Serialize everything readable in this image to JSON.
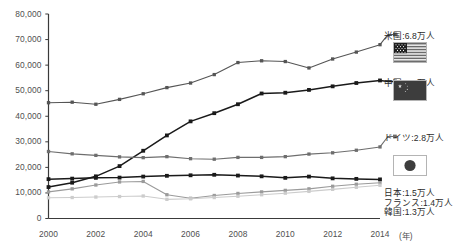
{
  "chart_data": {
    "type": "line",
    "title": "",
    "subtitle": "",
    "xlabel": "年",
    "ylabel": "",
    "x": [
      2000,
      2001,
      2002,
      2003,
      2004,
      2005,
      2006,
      2007,
      2008,
      2009,
      2010,
      2011,
      2012,
      2013,
      2014
    ],
    "xlim": [
      2000,
      2014
    ],
    "ylim": [
      0,
      80000
    ],
    "ytick_labels": [
      "0",
      "10,000",
      "20,000",
      "30,000",
      "40,000",
      "50,000",
      "60,000",
      "70,000",
      "80,000"
    ],
    "ytick_values": [
      0,
      10000,
      20000,
      30000,
      40000,
      50000,
      60000,
      70000,
      80000
    ],
    "xtick_labels": [
      "2000",
      "2002",
      "2004",
      "2006",
      "2008",
      "2010",
      "2012",
      "2014"
    ],
    "xtick_values": [
      2000,
      2002,
      2004,
      2006,
      2008,
      2010,
      2012,
      2014
    ],
    "grid": false,
    "legend_position": "right-inline",
    "series": [
      {
        "name": "米国",
        "label": "米国:6.8万人",
        "value_text": "6.8万人",
        "color": "#555555",
        "flag": "us-flag",
        "values": [
          45300,
          45500,
          44700,
          46600,
          48800,
          51200,
          53000,
          56300,
          61000,
          61700,
          61400,
          58900,
          62400,
          65100,
          68000
        ]
      },
      {
        "name": "中国",
        "label": "中国:5.4万人",
        "value_text": "5.4万人",
        "color": "#1a1a1a",
        "flag": "cn-flag",
        "values": [
          12300,
          14000,
          16500,
          20500,
          26500,
          32500,
          38000,
          41200,
          44700,
          48900,
          49200,
          50300,
          51700,
          53000,
          54000
        ]
      },
      {
        "name": "ドイツ",
        "label": "ドイツ:2.8万人",
        "value_text": "2.8万人",
        "color": "#6e6e6e",
        "flag": null,
        "values": [
          26200,
          25300,
          24700,
          24100,
          23800,
          24200,
          23400,
          23200,
          23900,
          23900,
          24200,
          25200,
          25700,
          26700,
          28000
        ]
      },
      {
        "name": "日本",
        "label": "日本:1.5万人",
        "value_text": "1.5万人",
        "color": "#1a1a1a",
        "flag": "jp-flag",
        "values": [
          15400,
          15600,
          15900,
          16000,
          16400,
          16700,
          16900,
          17100,
          16800,
          16500,
          15900,
          16400,
          15700,
          15500,
          15300
        ]
      },
      {
        "name": "フランス",
        "label": "フランス:1.4万人",
        "value_text": "1.4万人",
        "color": "#9b9b9b",
        "flag": null,
        "values": [
          10400,
          11600,
          13100,
          14300,
          14500,
          9300,
          7900,
          9000,
          9800,
          10400,
          11000,
          11600,
          12600,
          13400,
          14000
        ]
      },
      {
        "name": "韓国",
        "label": "韓国:1.3万人",
        "value_text": "1.3万人",
        "color": "#cccccc",
        "flag": null,
        "values": [
          8100,
          8200,
          8400,
          8600,
          8800,
          7500,
          7700,
          8200,
          8700,
          9300,
          9900,
          10600,
          11400,
          12200,
          13000
        ]
      }
    ]
  },
  "axis": {
    "unit_suffix": "(年)"
  }
}
